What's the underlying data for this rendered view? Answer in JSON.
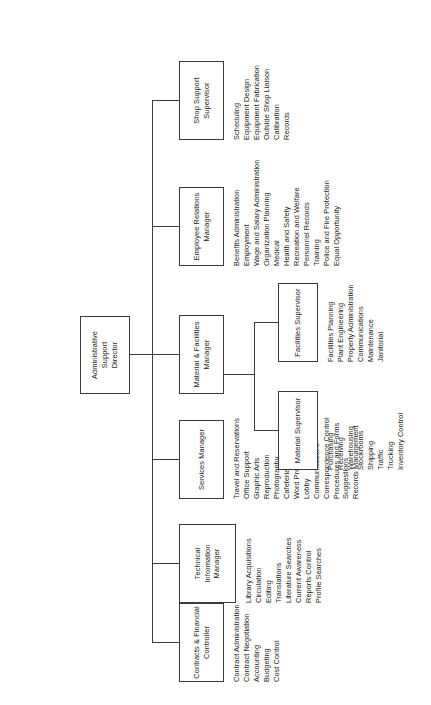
{
  "chart_title": "Administrative Support Organization Chart",
  "orientation": "rotated-90-ccw",
  "root": {
    "title": "Administrative\nSupport\nDirector"
  },
  "units": [
    {
      "id": "contracts-financial-controller",
      "title": "Contracts & Financial\nController",
      "functions": [
        "Contract Administration",
        "Contract Negotiation",
        "Accounting",
        "Budgeting",
        "Cost Control"
      ]
    },
    {
      "id": "technical-information-manager",
      "title": "Technical\nInformation\nManager",
      "functions": [
        "Library Acquisitions",
        "Circulation",
        "Editing",
        "Translations",
        "Literature Searches",
        "Current Awareness",
        "Reports Control",
        "Profile Searches"
      ]
    },
    {
      "id": "services-manager",
      "title": "Services Manager",
      "functions": [
        "Travel and Reservations",
        "Office Support",
        "Graphic Arts",
        "Reproduction",
        "Photography",
        "Cafeteria Services",
        "Word Processing",
        "Lobby",
        "Communications",
        "Correspondence Control",
        "Procedures and Forms",
        "Suggestions",
        "Records Management"
      ]
    },
    {
      "id": "material-facilities-manager",
      "title": "Material & Facilities\nManager",
      "functions": []
    },
    {
      "id": "employee-relations-manager",
      "title": "Employee Relations\nManager",
      "functions": [
        "Benefits Administration",
        "Employment",
        "Wage and Salary Administration",
        "Organization Planning",
        "Medical",
        "Health and Safety",
        "Recreation and Welfare",
        "Personnel Records",
        "Training",
        "Police and Fire Protection",
        "Equal Opportunity"
      ]
    },
    {
      "id": "shop-support-supervisor",
      "title": "Shop Support\nSupervisor",
      "functions": [
        "Scheduling",
        "Equipment Design",
        "Equipment Fabrication",
        "Outside Shop Liaison",
        "Calibration",
        "Records"
      ]
    }
  ],
  "sub_units": [
    {
      "id": "material-supervisor",
      "title": "Material Supervisor",
      "functions": [
        "Purchasing",
        "Receiving",
        "Warehousing",
        "Stockrooms",
        "Shipping",
        "Traffic",
        "Trucking",
        "Inventory Control"
      ]
    },
    {
      "id": "facilities-supervisor",
      "title": "Facilities Supervisor",
      "functions": [
        "Facilities Planning",
        "Plant Engineering",
        "Property Administration",
        "Communications",
        "Maintenance",
        "Janitorial"
      ]
    }
  ],
  "colors": {
    "stroke": "#3b3b3b",
    "text": "#1c1c1c",
    "background": "#ffffff"
  }
}
